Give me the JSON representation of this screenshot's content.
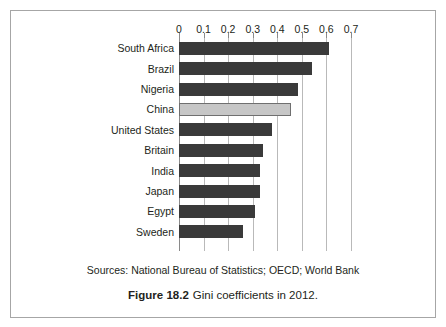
{
  "chart_data": {
    "type": "bar",
    "orientation": "horizontal",
    "title": "Gini coefficients in 2012.",
    "figure_number": "Figure 18.2",
    "xlabel": "",
    "ylabel": "",
    "xlim": [
      0,
      0.7
    ],
    "grid": true,
    "legend": "none",
    "categories": [
      "South Africa",
      "Brazil",
      "Nigeria",
      "China",
      "United States",
      "Britain",
      "India",
      "Japan",
      "Egypt",
      "Sweden"
    ],
    "values": [
      0.61,
      0.54,
      0.485,
      0.455,
      0.38,
      0.34,
      0.33,
      0.33,
      0.31,
      0.26
    ],
    "highlighted_category": "China",
    "tick_labels": [
      "0",
      "0.1",
      "0.2",
      "0.3",
      "0.4",
      "0.5",
      "0.6",
      "0.7"
    ],
    "tick_values": [
      0,
      0.1,
      0.2,
      0.3,
      0.4,
      0.5,
      0.6,
      0.7
    ],
    "colors": {
      "bar": "#3a3a3a",
      "bar_highlight": "#c6c6c6",
      "bar_highlight_border": "#6f6f6f",
      "gridline": "#b9b9b9",
      "axis": "#8a8a8a",
      "text": "#231f20",
      "frame": "#a6a6a6",
      "background": "#ffffff"
    }
  },
  "sources": {
    "text": "Sources: National Bureau of Statistics; OECD; World Bank"
  },
  "caption": {
    "number": "Figure 18.2",
    "title": "Gini coefficients in 2012."
  }
}
